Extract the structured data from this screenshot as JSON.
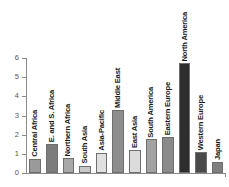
{
  "chart_data": {
    "type": "bar",
    "title": "",
    "xlabel": "",
    "ylabel": "",
    "ylim": [
      0,
      6
    ],
    "yticks": [
      "0",
      "1",
      "2",
      "3",
      "4",
      "5",
      "6"
    ],
    "grid": false,
    "legend": "none",
    "categories": [
      "Central Africa",
      "E. and S. Africa",
      "Northern Africa",
      "South Asia",
      "Asia-Pacific",
      "Middle East",
      "East Asia",
      "South America",
      "Eastern Europe",
      "North America",
      "Western Europe",
      "Japan"
    ],
    "values": [
      0.72,
      1.5,
      0.78,
      0.38,
      1.06,
      3.28,
      1.22,
      1.76,
      1.86,
      5.72,
      1.1,
      0.6
    ],
    "bar_colors": [
      "#9a9a9a",
      "#7c7c7c",
      "#a8a8a8",
      "#c9c9c9",
      "#e0e0e0",
      "#8d8d8d",
      "#dcdcdc",
      "#a2a2a2",
      "#8b8b8b",
      "#2e2e2e",
      "#4a4a4a",
      "#7f7f7f"
    ],
    "axis_color": "#8a8a8a",
    "label_color": "#1a1a1a",
    "background": "#ffffff"
  }
}
